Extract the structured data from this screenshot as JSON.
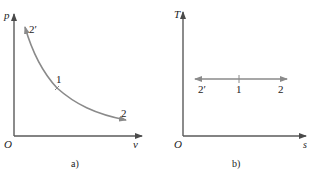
{
  "diagram_a": {
    "caption": "a)",
    "x_axis_label": "v",
    "y_axis_label": "p",
    "origin_label": "O",
    "points": [
      {
        "label": "2′",
        "position": "start (upper-left)"
      },
      {
        "label": "1",
        "position": "middle"
      },
      {
        "label": "2",
        "position": "end (lower-right)"
      }
    ],
    "curve": "hyperbolic isotherm p·v = const, arrows in both directions from point 1",
    "curve_color": "#8a8a8a"
  },
  "diagram_b": {
    "caption": "b)",
    "x_axis_label": "s",
    "y_axis_label": "T",
    "origin_label": "O",
    "points": [
      {
        "label": "2′",
        "position": "left"
      },
      {
        "label": "1",
        "position": "middle"
      },
      {
        "label": "2",
        "position": "right"
      }
    ],
    "curve": "horizontal line T = const, arrows in both directions from point 1",
    "curve_color": "#8a8a8a"
  },
  "colors": {
    "axis": "#5a5a5a",
    "text": "#222222",
    "background": "#ffffff"
  }
}
